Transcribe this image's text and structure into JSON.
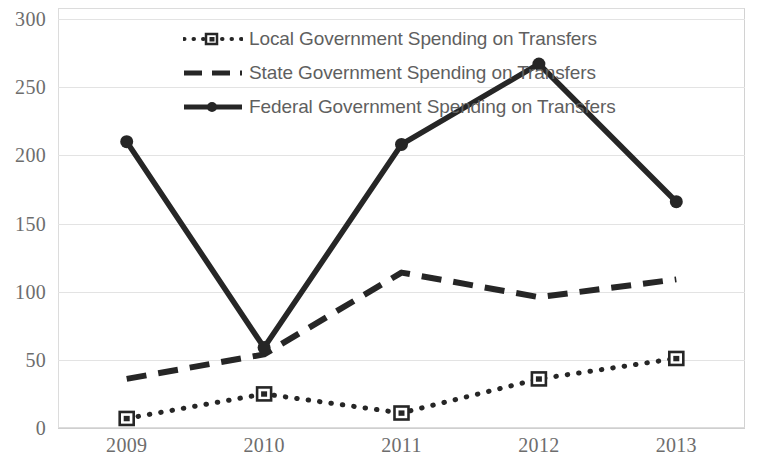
{
  "chart_data": {
    "type": "line",
    "title": "",
    "xlabel": "",
    "ylabel": "",
    "categories": [
      "2009",
      "2010",
      "2011",
      "2012",
      "2013"
    ],
    "ylim": [
      0,
      300
    ],
    "ytick_labels": [
      "0",
      "50",
      "100",
      "150",
      "200",
      "250",
      "300"
    ],
    "ytick_values": [
      0,
      50,
      100,
      150,
      200,
      250,
      300
    ],
    "grid": true,
    "legend_position": "top-center",
    "series": [
      {
        "name": "Local Government Spending on Transfers",
        "values": [
          7,
          25,
          11,
          36,
          51
        ],
        "style": "dotted",
        "marker": "square",
        "color": "#262626"
      },
      {
        "name": "State Government Spending on Transfers",
        "values": [
          36,
          54,
          114,
          96,
          109
        ],
        "style": "dashed",
        "marker": "none",
        "color": "#262626"
      },
      {
        "name": "Federal Government Spending on Transfers",
        "values": [
          210,
          59,
          208,
          267,
          166
        ],
        "style": "solid",
        "marker": "circle",
        "color": "#262626"
      }
    ]
  },
  "legend": {
    "items": [
      {
        "label": "Local Government Spending on Transfers"
      },
      {
        "label": "State Government Spending on Transfers"
      },
      {
        "label": "Federal Government Spending on Transfers"
      }
    ]
  },
  "axes": {
    "y_labels": [
      "300",
      "250",
      "200",
      "150",
      "100",
      "50",
      "0"
    ],
    "x_labels": [
      "2009",
      "2010",
      "2011",
      "2012",
      "2013"
    ]
  },
  "colors": {
    "series_ink": "#262626",
    "gridline": "#e3e3e3",
    "tick_text": "#6d6d6d",
    "legend_text": "#5f5f5f",
    "background": "#ffffff"
  }
}
